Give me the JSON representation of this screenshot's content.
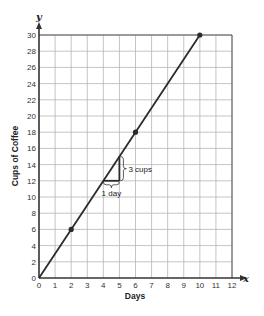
{
  "chart_data": {
    "type": "line",
    "title": "",
    "xlabel": "Days",
    "ylabel": "Cups of Coffee",
    "x_axis_var": "x",
    "y_axis_var": "y",
    "xlim": [
      0,
      12
    ],
    "ylim": [
      0,
      30
    ],
    "x_ticks": [
      0,
      1,
      2,
      3,
      4,
      5,
      6,
      7,
      8,
      9,
      10,
      11,
      12
    ],
    "y_ticks": [
      0,
      2,
      4,
      6,
      8,
      10,
      12,
      14,
      16,
      18,
      20,
      22,
      24,
      26,
      28,
      30
    ],
    "grid": true,
    "series": [
      {
        "name": "Cups of Coffee",
        "x": [
          0,
          2,
          6,
          10
        ],
        "y": [
          0,
          6,
          18,
          30
        ],
        "marked_points": [
          [
            2,
            6
          ],
          [
            6,
            18
          ],
          [
            10,
            30
          ]
        ]
      }
    ],
    "annotations": [
      {
        "type": "slope-triangle",
        "from": [
          4,
          12
        ],
        "to": [
          5,
          15
        ],
        "run_label": "1 day",
        "rise_label": "3 cups"
      }
    ],
    "slope": 3
  },
  "labels": {
    "xlabel": "Days",
    "ylabel": "Cups of Coffee",
    "x_var": "x",
    "y_var": "y",
    "run": "1 day",
    "rise": "3 cups"
  },
  "colors": {
    "line": "#2b2b2b",
    "grid": "#b5b5b5",
    "axis": "#333333"
  }
}
